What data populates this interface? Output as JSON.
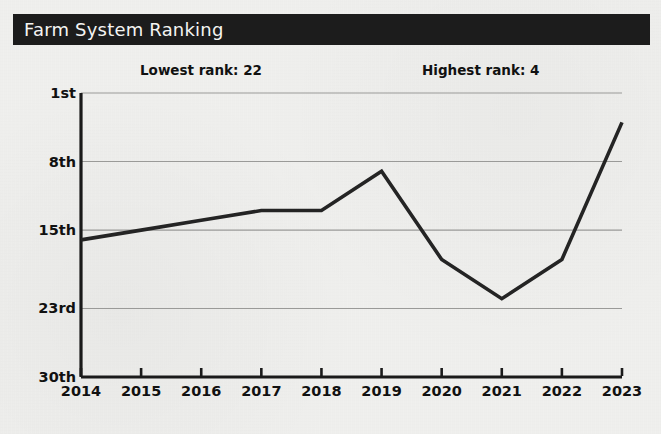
{
  "header": {
    "title": "Farm System Ranking"
  },
  "annotations": {
    "lowest": "Lowest rank: 22",
    "highest": "Highest rank: 4"
  },
  "colors": {
    "title_bar_bg": "#1c1c1c",
    "title_text": "#f4f4f2",
    "page_bg": "#f2f2f0",
    "line": "#242424",
    "gridline": "#9a9a98",
    "axis": "#1a1a1a",
    "tick_text": "#111111"
  },
  "chart_data": {
    "type": "line",
    "title": "Farm System Ranking",
    "xlabel": "",
    "ylabel": "",
    "grid": true,
    "legend": "none",
    "y_inverted": true,
    "ylim": [
      1,
      30
    ],
    "y_ticks": [
      1,
      8,
      15,
      23,
      30
    ],
    "y_tick_labels": [
      "1st",
      "8th",
      "15th",
      "23rd",
      "30th"
    ],
    "categories": [
      "2014",
      "2015",
      "2016",
      "2017",
      "2018",
      "2019",
      "2020",
      "2021",
      "2022",
      "2023"
    ],
    "x": [
      2014,
      2015,
      2016,
      2017,
      2018,
      2019,
      2020,
      2021,
      2022,
      2023
    ],
    "values": [
      16,
      15,
      14,
      13,
      13,
      9,
      18,
      22,
      18,
      4
    ],
    "series": [
      {
        "name": "Farm System Ranking",
        "values": [
          16,
          15,
          14,
          13,
          13,
          9,
          18,
          22,
          18,
          4
        ]
      }
    ],
    "annotations": [
      {
        "text": "Lowest rank: 22",
        "position": "top-left"
      },
      {
        "text": "Highest rank: 4",
        "position": "top-right"
      }
    ]
  }
}
